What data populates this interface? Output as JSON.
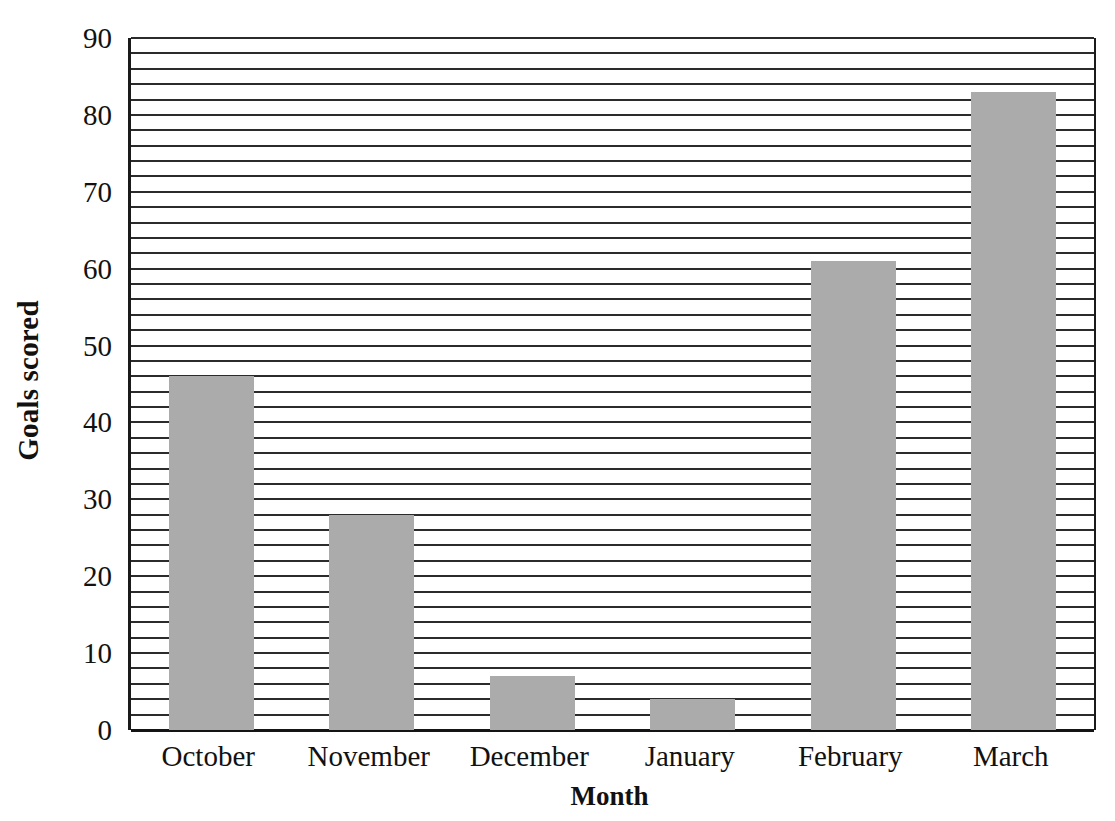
{
  "chart_data": {
    "type": "bar",
    "title": "",
    "xlabel": "Month",
    "ylabel": "Goals scored",
    "categories": [
      "October",
      "November",
      "December",
      "January",
      "February",
      "March"
    ],
    "values": [
      46,
      28,
      7,
      4,
      61,
      83
    ],
    "series": [
      {
        "name": "Goals scored",
        "values": [
          46,
          28,
          7,
          4,
          61,
          83
        ]
      }
    ],
    "ylim": [
      0,
      90
    ],
    "xlim_note": "categorical",
    "y_major_ticks": [
      0,
      10,
      20,
      30,
      40,
      50,
      60,
      70,
      80,
      90
    ],
    "y_tick_labels": [
      "0",
      "10",
      "20",
      "30",
      "40",
      "50",
      "60",
      "70",
      "80",
      "90"
    ],
    "y_minor_tick_step": 2,
    "grid": "horizontal-only",
    "gridline_values": [
      0,
      2,
      4,
      6,
      8,
      10,
      12,
      14,
      16,
      18,
      20,
      22,
      24,
      26,
      28,
      30,
      32,
      34,
      36,
      38,
      40,
      42,
      44,
      46,
      48,
      50,
      52,
      54,
      56,
      58,
      60,
      62,
      64,
      66,
      68,
      70,
      72,
      74,
      76,
      78,
      80,
      82,
      84,
      86,
      88,
      90
    ],
    "legend": "none",
    "legend_position": "none",
    "colors": {
      "bar_fill": "#ababab",
      "gridline": "#2b2b2b",
      "axis": "#141414",
      "background": "#ffffff",
      "text": "#111111"
    },
    "annotations": []
  }
}
